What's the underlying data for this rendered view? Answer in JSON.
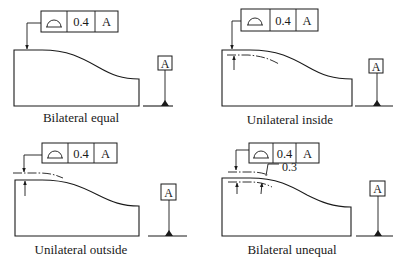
{
  "figure": {
    "panels": [
      {
        "caption": "Bilateral equal",
        "feature_control_frame": {
          "symbol": "profile-of-surface",
          "tolerance": "0.4",
          "datum": "A"
        },
        "datum_label": "A",
        "tolerance_zone": "bilateral-equal"
      },
      {
        "caption": "Unilateral inside",
        "feature_control_frame": {
          "symbol": "profile-of-surface",
          "tolerance": "0.4",
          "datum": "A"
        },
        "datum_label": "A",
        "tolerance_zone": "unilateral-inside"
      },
      {
        "caption": "Unilateral outside",
        "feature_control_frame": {
          "symbol": "profile-of-surface",
          "tolerance": "0.4",
          "datum": "A"
        },
        "datum_label": "A",
        "tolerance_zone": "unilateral-outside"
      },
      {
        "caption": "Bilateral unequal",
        "feature_control_frame": {
          "symbol": "profile-of-surface",
          "tolerance": "0.4",
          "datum": "A"
        },
        "datum_label": "A",
        "tolerance_zone": "bilateral-unequal",
        "offset_dimension": "0.3"
      }
    ],
    "colors": {
      "ink": "#1a1a1a",
      "background": "#ffffff"
    }
  }
}
